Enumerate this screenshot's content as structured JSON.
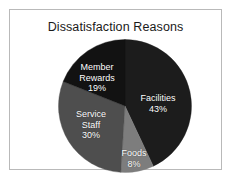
{
  "chart_data": {
    "type": "pie",
    "title": "Dissatisfaction Reasons",
    "xlabel": "",
    "ylabel": "",
    "legend_position": "none",
    "grid": false,
    "start_angle_deg": 0,
    "direction": "clockwise",
    "categories": [
      "Facilities",
      "Foods",
      "Service Staff",
      "Member Rewards"
    ],
    "values": [
      43,
      8,
      30,
      19
    ],
    "unit": "%",
    "labels_inside": true,
    "slices": [
      {
        "name": "Facilities",
        "value": 43,
        "label": "Facilities",
        "percent_label": "43%",
        "color": "#1c1c1c",
        "text_color": "#ffffff"
      },
      {
        "name": "Foods",
        "value": 8,
        "label": "Foods",
        "percent_label": "8%",
        "color": "#7d7d7d",
        "text_color": "#ffffff"
      },
      {
        "name": "Service Staff",
        "value": 30,
        "label": "Service\nStaff",
        "label_line1": "Service",
        "label_line2": "Staff",
        "percent_label": "30%",
        "color": "#4e4e4e",
        "text_color": "#ffffff"
      },
      {
        "name": "Member Rewards",
        "value": 19,
        "label": "Member\nRewards",
        "label_line1": "Member",
        "label_line2": "Rewards",
        "percent_label": "19%",
        "color": "#121212",
        "text_color": "#ffffff"
      }
    ]
  },
  "figure": {
    "title": "Dissatisfaction Reasons",
    "background_color": "#ffffff",
    "frame_color": "#b9b9b9"
  }
}
